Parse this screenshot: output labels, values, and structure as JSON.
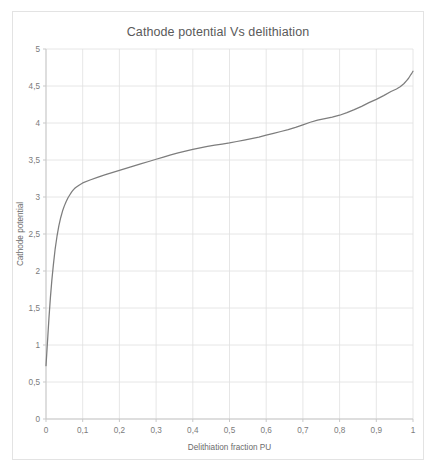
{
  "card": {
    "background": "#ffffff",
    "border_color": "#e3e3e3"
  },
  "chart_data": {
    "type": "line",
    "title": "Cathode potential Vs delithiation",
    "xlabel": "Delithiation fraction PU",
    "ylabel": "Cathode potential",
    "xlim": [
      0,
      1
    ],
    "ylim": [
      0,
      5
    ],
    "grid": true,
    "legend": null,
    "legend_position": "none",
    "xticks": [
      0,
      0.1,
      0.2,
      0.3,
      0.4,
      0.5,
      0.6,
      0.7,
      0.8,
      0.9,
      1
    ],
    "xtick_labels": [
      "0",
      "0,1",
      "0,2",
      "0,3",
      "0,4",
      "0,5",
      "0,6",
      "0,7",
      "0,8",
      "0,9",
      "1"
    ],
    "yticks": [
      0,
      0.5,
      1,
      1.5,
      2,
      2.5,
      3,
      3.5,
      4,
      4.5,
      5
    ],
    "ytick_labels": [
      "0",
      "0,5",
      "1",
      "1,5",
      "2",
      "2,5",
      "3",
      "3,5",
      "4",
      "4,5",
      "5"
    ],
    "series": [
      {
        "name": "Cathode potential",
        "color": "#7d7d7d",
        "x": [
          0.0,
          0.002,
          0.005,
          0.008,
          0.012,
          0.016,
          0.02,
          0.025,
          0.03,
          0.035,
          0.04,
          0.045,
          0.05,
          0.055,
          0.06,
          0.065,
          0.07,
          0.075,
          0.08,
          0.09,
          0.1,
          0.12,
          0.14,
          0.16,
          0.18,
          0.2,
          0.22,
          0.24,
          0.26,
          0.28,
          0.3,
          0.32,
          0.34,
          0.36,
          0.38,
          0.4,
          0.42,
          0.44,
          0.46,
          0.48,
          0.5,
          0.52,
          0.54,
          0.56,
          0.58,
          0.6,
          0.62,
          0.64,
          0.66,
          0.68,
          0.7,
          0.72,
          0.74,
          0.76,
          0.78,
          0.8,
          0.82,
          0.84,
          0.86,
          0.88,
          0.9,
          0.92,
          0.94,
          0.955,
          0.965,
          0.975,
          0.982,
          0.988,
          0.993,
          0.997,
          1.0
        ],
        "y": [
          0.72,
          0.88,
          1.12,
          1.36,
          1.64,
          1.88,
          2.08,
          2.3,
          2.47,
          2.61,
          2.72,
          2.81,
          2.88,
          2.94,
          2.99,
          3.03,
          3.07,
          3.1,
          3.125,
          3.16,
          3.19,
          3.23,
          3.265,
          3.3,
          3.33,
          3.36,
          3.39,
          3.42,
          3.45,
          3.48,
          3.51,
          3.54,
          3.57,
          3.595,
          3.62,
          3.645,
          3.665,
          3.685,
          3.7,
          3.715,
          3.73,
          3.75,
          3.77,
          3.79,
          3.81,
          3.835,
          3.86,
          3.885,
          3.91,
          3.94,
          3.975,
          4.01,
          4.04,
          4.06,
          4.08,
          4.105,
          4.14,
          4.18,
          4.225,
          4.275,
          4.32,
          4.37,
          4.425,
          4.46,
          4.49,
          4.53,
          4.57,
          4.605,
          4.645,
          4.675,
          4.7
        ]
      }
    ]
  }
}
